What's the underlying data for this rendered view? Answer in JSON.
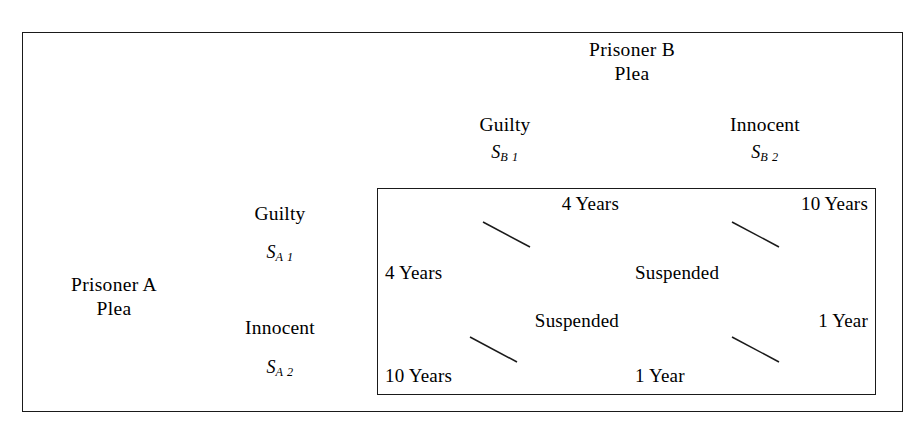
{
  "figure": {
    "background_color": "#ffffff",
    "line_color": "#1a1a1a"
  },
  "column_player": {
    "title_line1": "Prisoner B",
    "title_line2": "Plea",
    "strategies": [
      {
        "name": "Guilty",
        "symbol": "S",
        "subscript": "B 1"
      },
      {
        "name": "Innocent",
        "symbol": "S",
        "subscript": "B 2"
      }
    ]
  },
  "row_player": {
    "title_line1": "Prisoner A",
    "title_line2": "Plea",
    "strategies": [
      {
        "name": "Guilty",
        "symbol": "S",
        "subscript": "A 1"
      },
      {
        "name": "Innocent",
        "symbol": "S",
        "subscript": "A 2"
      }
    ]
  },
  "matrix": {
    "cells": [
      {
        "row": "S_A1",
        "col": "S_B1",
        "column_player_payoff": "4 Years",
        "row_player_payoff": "4 Years"
      },
      {
        "row": "S_A1",
        "col": "S_B2",
        "column_player_payoff": "10 Years",
        "row_player_payoff": "Suspended"
      },
      {
        "row": "S_A2",
        "col": "S_B1",
        "column_player_payoff": "Suspended",
        "row_player_payoff": "10 Years"
      },
      {
        "row": "S_A2",
        "col": "S_B2",
        "column_player_payoff": "1 Year",
        "row_player_payoff": "1 Year"
      }
    ]
  }
}
